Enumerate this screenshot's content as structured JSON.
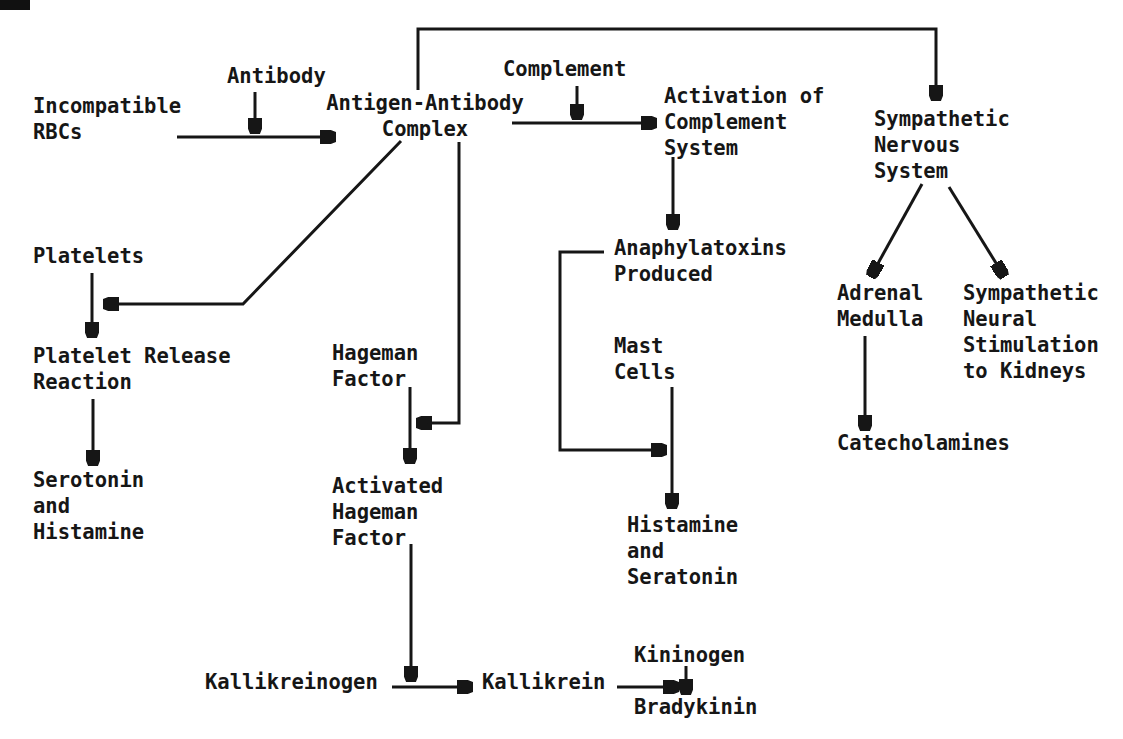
{
  "colors": {
    "ink": "#161616",
    "background": "#ffffff"
  },
  "nodes": {
    "incompatible_rbcs": "Incompatible\nRBCs",
    "antibody": "Antibody",
    "antigen_antibody_complex": "Antigen-Antibody\nComplex",
    "complement": "Complement",
    "activation_complement_system": "Activation of\nComplement\nSystem",
    "sympathetic_nervous_system": "Sympathetic\nNervous\nSystem",
    "platelets": "Platelets",
    "platelet_release_reaction": "Platelet Release\nReaction",
    "serotonin_and_histamine": "Serotonin\nand\nHistamine",
    "hageman_factor": "Hageman\nFactor",
    "activated_hageman_factor": "Activated\nHageman\nFactor",
    "anaphylatoxins_produced": "Anaphylatoxins\nProduced",
    "mast_cells": "Mast\nCells",
    "histamine_and_seratonin": "Histamine\nand\nSeratonin",
    "adrenal_medulla": "Adrenal\nMedulla",
    "sympathetic_neural_stimulation": "Sympathetic\nNeural\nStimulation\nto Kidneys",
    "catecholamines": "Catecholamines",
    "kallikreinogen": "Kallikreinogen",
    "kallikrein": "Kallikrein",
    "kininogen": "Kininogen",
    "bradykinin": "Bradykinin"
  },
  "edges": [
    {
      "from": "incompatible_rbcs",
      "to": "antigen_antibody_complex",
      "via": "antibody"
    },
    {
      "from": "antigen_antibody_complex",
      "to": "activation_complement_system",
      "via": "complement"
    },
    {
      "from": "activation_complement_system",
      "to": "anaphylatoxins_produced"
    },
    {
      "from": "antigen_antibody_complex",
      "to": "sympathetic_nervous_system"
    },
    {
      "from": "antigen_antibody_complex",
      "to": "platelets"
    },
    {
      "from": "platelets",
      "to": "platelet_release_reaction"
    },
    {
      "from": "platelet_release_reaction",
      "to": "serotonin_and_histamine"
    },
    {
      "from": "antigen_antibody_complex",
      "to": "hageman_factor"
    },
    {
      "from": "hageman_factor",
      "to": "activated_hageman_factor"
    },
    {
      "from": "activated_hageman_factor",
      "to": "kallikreinogen"
    },
    {
      "from": "kallikreinogen",
      "to": "kallikrein"
    },
    {
      "from": "kallikrein",
      "to": "bradykinin",
      "via": "kininogen"
    },
    {
      "from": "kininogen",
      "to": "bradykinin"
    },
    {
      "from": "anaphylatoxins_produced",
      "to": "mast_cells"
    },
    {
      "from": "mast_cells",
      "to": "histamine_and_seratonin"
    },
    {
      "from": "sympathetic_nervous_system",
      "to": "adrenal_medulla"
    },
    {
      "from": "sympathetic_nervous_system",
      "to": "sympathetic_neural_stimulation"
    },
    {
      "from": "adrenal_medulla",
      "to": "catecholamines"
    }
  ]
}
